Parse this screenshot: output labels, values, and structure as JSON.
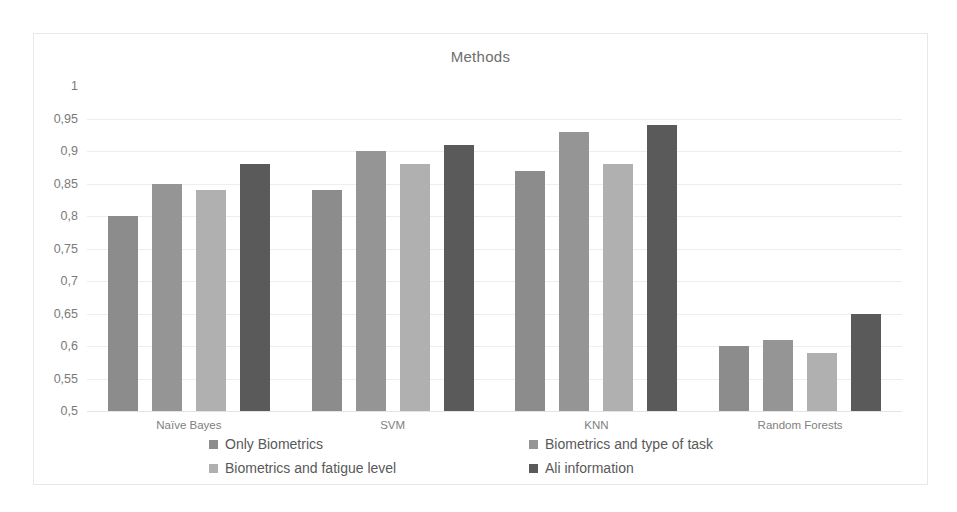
{
  "chart_data": {
    "type": "bar",
    "title": "Methods",
    "xlabel": "",
    "ylabel": "",
    "ylim": [
      0.5,
      1
    ],
    "ytick_labels": [
      "1",
      "0,95",
      "0,9",
      "0,85",
      "0,8",
      "0,75",
      "0,7",
      "0,65",
      "0,6",
      "0,55",
      "0,5"
    ],
    "ytick_values": [
      1,
      0.95,
      0.9,
      0.85,
      0.8,
      0.75,
      0.7,
      0.65,
      0.6,
      0.55,
      0.5
    ],
    "grid": true,
    "legend_position": "bottom",
    "decimal_separator": ",",
    "categories": [
      "Naïve Bayes",
      "SVM",
      "KNN",
      "Random Forests"
    ],
    "series": [
      {
        "name": "Only Biometrics",
        "color": "#8c8c8c",
        "values": [
          0.8,
          0.84,
          0.87,
          0.6
        ]
      },
      {
        "name": "Biometrics and type of task",
        "color": "#959595",
        "values": [
          0.85,
          0.9,
          0.93,
          0.61
        ]
      },
      {
        "name": "Biometrics and fatigue level",
        "color": "#b0b0b0",
        "values": [
          0.84,
          0.88,
          0.88,
          0.59
        ]
      },
      {
        "name": "All information",
        "color": "#5a5a5a",
        "values": [
          0.88,
          0.91,
          0.94,
          0.65
        ]
      }
    ]
  },
  "legend": {
    "items": [
      {
        "label": "Only Biometrics",
        "color": "#8c8c8c"
      },
      {
        "label": "Biometrics and type of task",
        "color": "#959595"
      },
      {
        "label": "Biometrics and fatigue level",
        "color": "#b0b0b0"
      },
      {
        "label": "Ali information",
        "color": "#5a5a5a"
      }
    ]
  }
}
